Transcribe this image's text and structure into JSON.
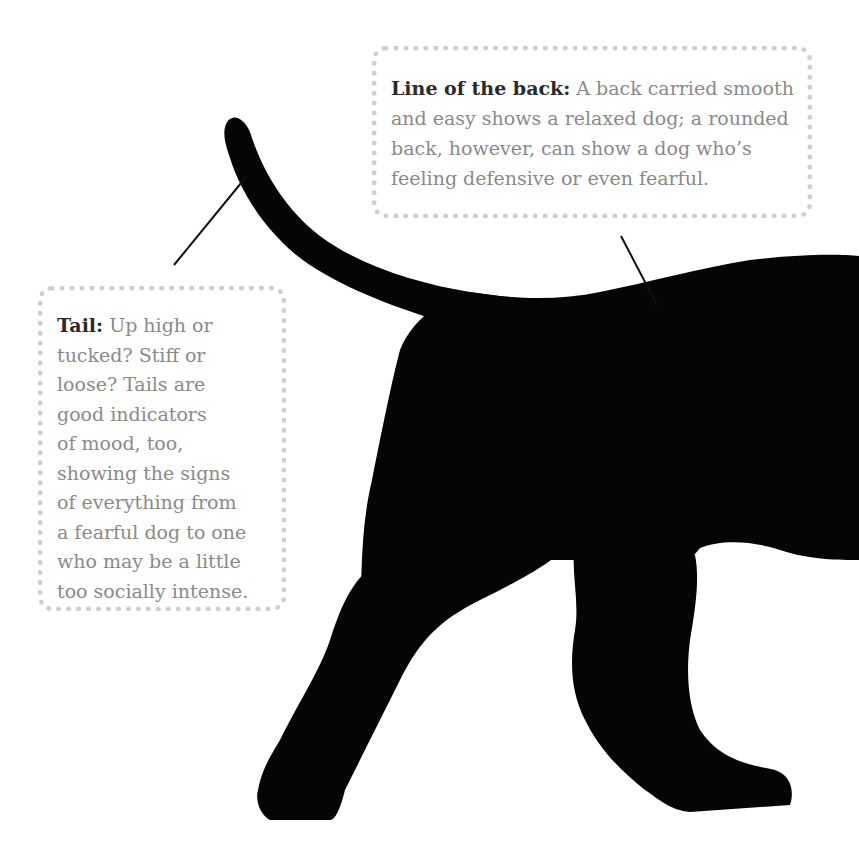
{
  "callouts": {
    "back": {
      "heading": "Line of the back:",
      "lines": [
        "A back carried smooth",
        "and easy shows a relaxed dog; a rounded",
        "back, however, can show a dog who’s",
        "feeling defensive or even fearful."
      ]
    },
    "tail": {
      "heading": "Tail:",
      "lines": [
        "Up high or",
        "tucked? Stiff or",
        "loose? Tails are",
        "good indicators",
        "of mood, too,",
        "showing the signs",
        "of everything from",
        "a fearful dog to one",
        "who may be a little",
        "too socially intense."
      ]
    }
  },
  "colors": {
    "dog": "#050505",
    "dots": "#cfcfcf",
    "heading": "#2a2a2a",
    "body_text": "#8a8a8a"
  }
}
